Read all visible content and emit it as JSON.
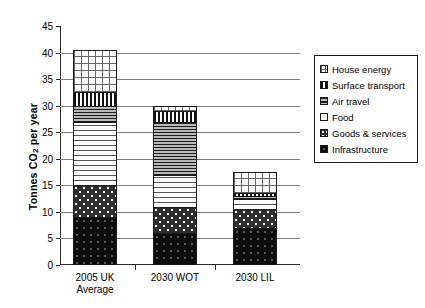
{
  "chart_data": {
    "type": "bar",
    "subtype": "stacked-bar",
    "title": "",
    "xlabel": "",
    "ylabel": "Tonnes CO2 per year",
    "ylabel_rich": {
      "pre": "Tonnes CO",
      "sub": "2",
      "post": " per year"
    },
    "ylim": [
      0,
      45
    ],
    "ytick_step": 5,
    "yticks": [
      "45",
      "40",
      "35",
      "30",
      "25",
      "20",
      "15",
      "10",
      "5",
      "0"
    ],
    "ytick_values": [
      45,
      40,
      35,
      30,
      25,
      20,
      15,
      10,
      5,
      0
    ],
    "grid": true,
    "grid_axis": "y",
    "legend_position": "right",
    "categories": [
      "2005 UK Average",
      "2030 WOT",
      "2030 LIL"
    ],
    "category_lines": [
      [
        "2005 UK",
        "Average"
      ],
      [
        "2030 WOT",
        ""
      ],
      [
        "2030 LIL",
        ""
      ]
    ],
    "series": [
      {
        "name": "Infrastructure",
        "pattern": "infra",
        "values": [
          9.0,
          6.0,
          7.0
        ]
      },
      {
        "name": "Goods & services",
        "pattern": "goods",
        "values": [
          6.0,
          5.0,
          3.5
        ]
      },
      {
        "name": "Food",
        "pattern": "food",
        "values": [
          12.0,
          6.0,
          2.0
        ]
      },
      {
        "name": "Air travel",
        "pattern": "air",
        "values": [
          3.0,
          10.0,
          0.5
        ]
      },
      {
        "name": "Surface transport",
        "pattern": "surface",
        "values": [
          2.5,
          2.0,
          0.6
        ]
      },
      {
        "name": "House energy",
        "pattern": "house",
        "values": [
          8.0,
          1.0,
          3.9
        ]
      }
    ],
    "totals": [
      40.5,
      30.0,
      17.5
    ],
    "stack_order_bottom_to_top": [
      "Infrastructure",
      "Goods & services",
      "Food",
      "Air travel",
      "Surface transport",
      "House energy"
    ]
  },
  "legend": {
    "items": [
      {
        "label": "House energy",
        "pattern": "house"
      },
      {
        "label": "Surface transport",
        "pattern": "surface"
      },
      {
        "label": "Air travel",
        "pattern": "air"
      },
      {
        "label": "Food",
        "pattern": "food"
      },
      {
        "label": "Goods & services",
        "pattern": "goods"
      },
      {
        "label": "Infrastructure",
        "pattern": "infra"
      }
    ]
  },
  "colors": {
    "axis": "#2b2b2b",
    "grid": "#7d7d7d",
    "background": "#ffffff",
    "outline": "#1a1a1a"
  }
}
